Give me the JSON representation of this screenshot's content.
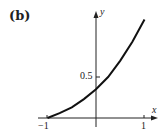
{
  "panel_label": "(b)",
  "chart_data": {
    "type": "line",
    "title": "",
    "xlabel": "x",
    "ylabel": "y",
    "xlim": [
      -1,
      1
    ],
    "x_ticks": [
      "-1",
      "1"
    ],
    "y_ticks": [
      "0.5"
    ],
    "grid": false,
    "series": [
      {
        "name": "curve",
        "x": [
          -1,
          -0.75,
          -0.5,
          -0.25,
          0,
          0.25,
          0.5,
          0.75,
          1
        ],
        "y": [
          0,
          0.06,
          0.13,
          0.23,
          0.35,
          0.5,
          0.7,
          0.93,
          1.2
        ]
      }
    ]
  },
  "labels": {
    "x_axis": "x",
    "y_axis": "y",
    "tick_neg1": "−1",
    "tick_pos1": "1",
    "tick_half": "0.5"
  }
}
